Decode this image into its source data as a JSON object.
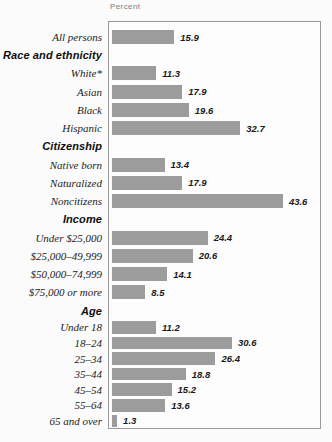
{
  "chart_data": {
    "type": "bar",
    "orientation": "horizontal",
    "axis_title": "Percent",
    "value_unit": "percent",
    "xlim": [
      0,
      50
    ],
    "grid": false,
    "legend": null,
    "bar_color": "#9c9c9c",
    "plot_border_color": "#9a9a9a",
    "value_text_color": "#1a1a1a",
    "sections": [
      {
        "header": null,
        "rows": [
          {
            "label": "All persons",
            "value": 15.9
          }
        ]
      },
      {
        "header": "Race and ethnicity",
        "rows": [
          {
            "label": "White*",
            "value": 11.3
          },
          {
            "label": "Asian",
            "value": 17.9
          },
          {
            "label": "Black",
            "value": 19.6
          },
          {
            "label": "Hispanic",
            "value": 32.7
          }
        ]
      },
      {
        "header": "Citizenship",
        "rows": [
          {
            "label": "Native born",
            "value": 13.4
          },
          {
            "label": "Naturalized",
            "value": 17.9
          },
          {
            "label": "Noncitizens",
            "value": 43.6
          }
        ]
      },
      {
        "header": "Income",
        "rows": [
          {
            "label": "Under $25,000",
            "value": 24.4
          },
          {
            "label": "$25,000–49,999",
            "value": 20.6
          },
          {
            "label": "$50,000–74,999",
            "value": 14.1
          },
          {
            "label": "$75,000 or more",
            "value": 8.5
          }
        ]
      },
      {
        "header": "Age",
        "rows": [
          {
            "label": "Under 18",
            "value": 11.2
          },
          {
            "label": "18–24",
            "value": 30.6
          },
          {
            "label": "25–34",
            "value": 26.4
          },
          {
            "label": "35–44",
            "value": 18.8
          },
          {
            "label": "45–54",
            "value": 15.2
          },
          {
            "label": "55–64",
            "value": 13.6
          },
          {
            "label": "65 and over",
            "value": 1.3
          }
        ]
      }
    ]
  }
}
